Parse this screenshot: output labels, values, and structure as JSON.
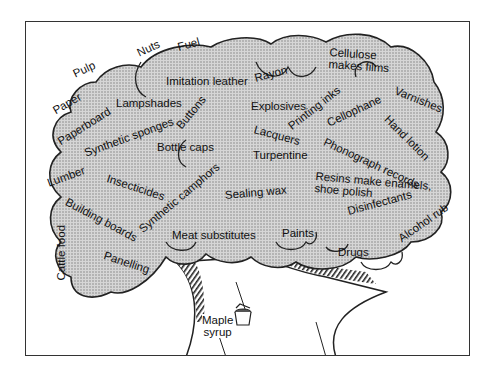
{
  "colors": {
    "canopy_fill": "#c8c8c8",
    "outline": "#222222",
    "frame": "#333333",
    "background": "#ffffff"
  },
  "diagram": {
    "labels": {
      "pulp": "Pulp",
      "nuts": "Nuts",
      "fuel": "Fuel",
      "imitation_leather": "Imitation leather",
      "rayon": "Rayon",
      "cellulose": "Cellulose\nmakes films",
      "paper": "Paper",
      "paperboard": "Paperboard",
      "lampshades": "Lampshades",
      "buttons": "Buttons",
      "explosives": "Explosives",
      "printing_inks": "Printing inks",
      "cellophane": "Cellophane",
      "varnishes": "Varnishes",
      "synthetic_sponges": "Synthetic sponges",
      "lacquers": "Lacquers",
      "hand_lotion": "Hand lotion",
      "phonograph_records": "Phonograph records",
      "bottle_caps": "Bottle caps",
      "turpentine": "Turpentine",
      "lumber": "Lumber",
      "insecticides": "Insecticides",
      "resins": "Resins make enamels,\nshoe polish",
      "building_boards": "Building boards",
      "synthetic_camphors": "Synthetic camphors",
      "sealing_wax": "Sealing wax",
      "disinfectants": "Disinfectants",
      "cattle_food": "Cattle food",
      "alcohol_rub": "Alcohol rub",
      "meat_substitutes": "Meat substitutes",
      "paints": "Paints",
      "panelling": "Panelling",
      "drugs": "Drugs",
      "maple_syrup": "Maple\nsyrup"
    }
  }
}
